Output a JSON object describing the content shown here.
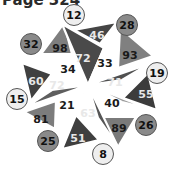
{
  "header": {
    "title": "Page 324"
  },
  "puzzle": {
    "center": [
      88,
      85
    ],
    "inner_triangles": [
      {
        "label": "72",
        "fill": "#4a4a4a",
        "text": "#e8e8e8",
        "pts": [
          [
            88,
            85
          ],
          [
            62,
            24
          ],
          [
            104,
            48
          ]
        ],
        "pos": [
          83,
          58
        ]
      },
      {
        "label": "33",
        "fill": "#8c8c8c",
        "text": "#1a1a1a",
        "pts": [
          [
            88,
            85
          ],
          [
            119,
            23
          ],
          [
            104,
            48
          ]
        ],
        "pos": [
          105,
          63
        ]
      },
      {
        "label": "71",
        "fill": "#505050",
        "text": "#e8e8e8",
        "pts": [
          [
            88,
            85
          ],
          [
            149,
            64
          ],
          [
            122,
            80
          ]
        ],
        "pos": [
          115,
          82
        ]
      },
      {
        "label": "40",
        "fill": "#9a9a9a",
        "text": "#1a1a1a",
        "pts": [
          [
            88,
            85
          ],
          [
            150,
            109
          ],
          [
            122,
            102
          ]
        ],
        "pos": [
          112,
          103
        ]
      },
      {
        "label": "63",
        "fill": "#555555",
        "text": "#e8e8e8",
        "pts": [
          [
            88,
            85
          ],
          [
            117,
            145
          ],
          [
            98,
            118
          ]
        ],
        "pos": [
          88,
          113
        ]
      },
      {
        "label": "21",
        "fill": "#9c9c9c",
        "text": "#1a1a1a",
        "pts": [
          [
            88,
            85
          ],
          [
            60,
            146
          ],
          [
            74,
            118
          ]
        ],
        "pos": [
          67,
          105
        ]
      },
      {
        "label": "72",
        "fill": "#5e5e5e",
        "text": "#e8e8e8",
        "pts": [
          [
            88,
            85
          ],
          [
            26,
            107
          ],
          [
            52,
            90
          ]
        ],
        "pos": [
          57,
          85
        ]
      },
      {
        "label": "34",
        "fill": "#a0a0a0",
        "text": "#1a1a1a",
        "pts": [
          [
            88,
            85
          ],
          [
            27,
            60
          ],
          [
            56,
            70
          ]
        ],
        "pos": [
          68,
          69
        ]
      }
    ],
    "outer_triangles": [
      {
        "label": "46",
        "fill": "#454545",
        "text": "#e8e8e8",
        "pts": [
          [
            74,
            30
          ],
          [
            117,
            22
          ],
          [
            100,
            44
          ]
        ],
        "pos": [
          97,
          35
        ]
      },
      {
        "label": "93",
        "fill": "#808080",
        "text": "#1a1a1a",
        "pts": [
          [
            120,
            28
          ],
          [
            153,
            56
          ],
          [
            118,
            68
          ]
        ],
        "pos": [
          130,
          55
        ]
      },
      {
        "label": "55",
        "fill": "#3c3c3c",
        "text": "#e8e8e8",
        "pts": [
          [
            148,
            73
          ],
          [
            157,
            110
          ],
          [
            123,
            98
          ]
        ],
        "pos": [
          146,
          94
        ]
      },
      {
        "label": "89",
        "fill": "#7a7a7a",
        "text": "#1a1a1a",
        "pts": [
          [
            136,
            117
          ],
          [
            118,
            147
          ],
          [
            101,
            117
          ]
        ],
        "pos": [
          119,
          128
        ]
      },
      {
        "label": "51",
        "fill": "#3f3f3f",
        "text": "#e8e8e8",
        "pts": [
          [
            99,
            140
          ],
          [
            62,
            149
          ],
          [
            76,
            115
          ]
        ],
        "pos": [
          78,
          138
        ]
      },
      {
        "label": "81",
        "fill": "#7c7c7c",
        "text": "#1a1a1a",
        "pts": [
          [
            24,
            112
          ],
          [
            56,
            101
          ],
          [
            55,
            129
          ]
        ],
        "pos": [
          41,
          119
        ]
      },
      {
        "label": "60",
        "fill": "#404040",
        "text": "#e8e8e8",
        "pts": [
          [
            22,
            63
          ],
          [
            52,
            74
          ],
          [
            31,
            101
          ]
        ],
        "pos": [
          36,
          81
        ]
      },
      {
        "label": "98",
        "fill": "#7e7e7e",
        "text": "#1a1a1a",
        "pts": [
          [
            64,
            23
          ],
          [
            72,
            54
          ],
          [
            41,
            54
          ]
        ],
        "pos": [
          60,
          48
        ]
      }
    ],
    "circles": [
      {
        "label": "12",
        "fill": "#eeeeee",
        "pos": [
          74,
          15
        ]
      },
      {
        "label": "28",
        "fill": "#8a8a8a",
        "pos": [
          127,
          25
        ]
      },
      {
        "label": "19",
        "fill": "#eeeeee",
        "pos": [
          157,
          73
        ]
      },
      {
        "label": "26",
        "fill": "#8a8a8a",
        "pos": [
          146,
          125
        ]
      },
      {
        "label": "8",
        "fill": "#eeeeee",
        "pos": [
          103,
          154
        ]
      },
      {
        "label": "25",
        "fill": "#8a8a8a",
        "pos": [
          48,
          141
        ]
      },
      {
        "label": "15",
        "fill": "#eeeeee",
        "pos": [
          17,
          99
        ]
      },
      {
        "label": "32",
        "fill": "#8a8a8a",
        "pos": [
          31,
          44
        ]
      }
    ]
  }
}
